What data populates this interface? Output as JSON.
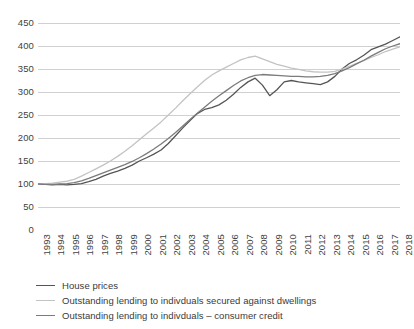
{
  "chart_data": {
    "type": "line",
    "title": "",
    "xlabel": "",
    "ylabel": "",
    "xlim": [
      1993,
      2018
    ],
    "ylim": [
      0,
      450
    ],
    "ytick_step": 50,
    "grid": true,
    "legend_position": "bottom-left",
    "index_base": "1993 = 100",
    "yticks": [
      0,
      50,
      100,
      150,
      200,
      250,
      300,
      350,
      400,
      450
    ],
    "ytick_labels": [
      "0",
      "50",
      "100",
      "150",
      "200",
      "250",
      "300",
      "350",
      "400",
      "450"
    ],
    "xticks": [
      1993,
      1994,
      1995,
      1996,
      1997,
      1998,
      1999,
      2000,
      2001,
      2002,
      2003,
      2004,
      2005,
      2006,
      2007,
      2008,
      2009,
      2010,
      2011,
      2012,
      2013,
      2014,
      2015,
      2016,
      2017,
      2018
    ],
    "xtick_labels": [
      "1993",
      "1994",
      "1995",
      "1996",
      "1997",
      "1998",
      "1999",
      "2000",
      "2001",
      "2002",
      "2003",
      "2004",
      "2005",
      "2006",
      "2007",
      "2008",
      "2009",
      "2010",
      "2011",
      "2012",
      "2013",
      "2014",
      "2015",
      "2016",
      "2017",
      "2018"
    ],
    "x": [
      1993,
      1993.5,
      1994,
      1994.5,
      1995,
      1995.5,
      1996,
      1996.5,
      1997,
      1997.5,
      1998,
      1998.5,
      1999,
      1999.5,
      2000,
      2000.5,
      2001,
      2001.5,
      2002,
      2002.5,
      2003,
      2003.5,
      2004,
      2004.5,
      2005,
      2005.5,
      2006,
      2006.5,
      2007,
      2007.5,
      2008,
      2008.5,
      2009,
      2009.5,
      2010,
      2010.5,
      2011,
      2011.5,
      2012,
      2012.5,
      2013,
      2013.5,
      2014,
      2014.5,
      2015,
      2015.5,
      2016,
      2016.5,
      2017,
      2017.5,
      2018
    ],
    "series": [
      {
        "name": "House prices",
        "color": "#555555",
        "values": [
          100,
          99,
          98,
          99,
          98,
          99,
          101,
          105,
          110,
          117,
          123,
          128,
          134,
          141,
          150,
          157,
          165,
          174,
          188,
          205,
          222,
          238,
          253,
          262,
          266,
          272,
          282,
          295,
          310,
          322,
          330,
          315,
          292,
          305,
          322,
          325,
          322,
          320,
          318,
          316,
          322,
          334,
          350,
          362,
          370,
          380,
          392,
          398,
          404,
          412,
          420
        ]
      },
      {
        "name": "Outstanding lending to indivduals secured against dwellings",
        "color": "#c3c3c3",
        "values": [
          100,
          101,
          102,
          104,
          106,
          110,
          117,
          125,
          133,
          141,
          150,
          160,
          171,
          183,
          196,
          209,
          222,
          235,
          250,
          265,
          281,
          296,
          311,
          325,
          337,
          346,
          354,
          362,
          370,
          375,
          378,
          372,
          366,
          360,
          356,
          352,
          349,
          346,
          344,
          343,
          343,
          345,
          350,
          356,
          362,
          368,
          375,
          381,
          388,
          393,
          398
        ]
      },
      {
        "name": "Outstanding lending to indivduals – consumer credit",
        "color": "#7b7b7b",
        "values": [
          100,
          99,
          99,
          100,
          101,
          103,
          107,
          112,
          118,
          124,
          130,
          136,
          142,
          149,
          157,
          166,
          176,
          187,
          199,
          212,
          226,
          240,
          254,
          267,
          280,
          292,
          303,
          314,
          324,
          331,
          336,
          338,
          337,
          336,
          335,
          334,
          334,
          333,
          333,
          334,
          336,
          340,
          346,
          353,
          361,
          369,
          378,
          386,
          394,
          400,
          405
        ]
      }
    ]
  },
  "legend": {
    "items": [
      {
        "label": "House prices",
        "color": "#555555"
      },
      {
        "label": "Outstanding lending to indivduals secured against dwellings",
        "color": "#c3c3c3"
      },
      {
        "label": "Outstanding lending to indivduals – consumer credit",
        "color": "#7b7b7b"
      }
    ]
  },
  "axis_style": {
    "gridline_color": "#d0d0d0",
    "axis_color": "#808080",
    "tick_color": "#808080"
  }
}
